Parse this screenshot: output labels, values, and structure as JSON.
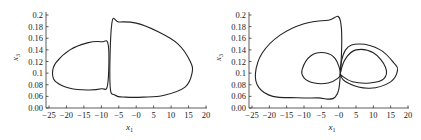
{
  "chart_data": [
    {
      "type": "line",
      "title": "",
      "xlabel": "x1",
      "ylabel": "x3",
      "xlim": [
        -25,
        20
      ],
      "ylim": [
        0.0,
        0.2
      ],
      "grid": false,
      "legend": null,
      "xticks": [
        "-25",
        "-20",
        "-15",
        "-10",
        "-5",
        "-0",
        "5",
        "10",
        "15",
        "20"
      ],
      "yticks": [
        "0.00",
        "0.06",
        "0.08",
        "0.1",
        "0.12",
        "0.14",
        "0.16",
        "0.18",
        "0.2"
      ],
      "series": [
        {
          "name": "left lobe",
          "x": [
            -8,
            -10,
            -14,
            -19,
            -23,
            -24,
            -23,
            -19,
            -14,
            -10,
            -8.2,
            -8
          ],
          "y": [
            0.148,
            0.154,
            0.152,
            0.14,
            0.118,
            0.1,
            0.085,
            0.074,
            0.071,
            0.073,
            0.08,
            0.148
          ]
        },
        {
          "name": "right lobe",
          "x": [
            -7.5,
            -7,
            -5,
            0,
            6,
            12,
            15.5,
            16,
            14,
            8,
            2,
            -3,
            -6,
            -7.5
          ],
          "y": [
            0.08,
            0.185,
            0.188,
            0.186,
            0.172,
            0.15,
            0.12,
            0.1,
            0.076,
            0.062,
            0.056,
            0.056,
            0.062,
            0.08
          ]
        }
      ]
    },
    {
      "type": "line",
      "title": "",
      "xlabel": "x1",
      "ylabel": "x3",
      "xlim": [
        -25,
        20
      ],
      "ylim": [
        0.0,
        0.2
      ],
      "grid": false,
      "legend": null,
      "xticks": [
        "-25",
        "-20",
        "-15",
        "-10",
        "-5",
        "-0",
        "5",
        "10",
        "15",
        "20"
      ],
      "yticks": [
        "0.00",
        "0.06",
        "0.08",
        "0.1",
        "0.12",
        "0.14",
        "0.16",
        "0.18",
        "0.2"
      ],
      "series": [
        {
          "name": "outer left loop",
          "x": [
            0.5,
            0.5,
            -3,
            -10,
            -17,
            -22,
            -24,
            -23,
            -19,
            -12,
            -6,
            -1,
            0.5
          ],
          "y": [
            0.1,
            0.19,
            0.191,
            0.185,
            0.165,
            0.135,
            0.1,
            0.075,
            0.06,
            0.053,
            0.052,
            0.056,
            0.1
          ]
        },
        {
          "name": "inner left loop",
          "x": [
            0.5,
            -1,
            -4,
            -8,
            -10.5,
            -10,
            -7,
            -3,
            -0.5,
            0.5
          ],
          "y": [
            0.1,
            0.125,
            0.135,
            0.13,
            0.107,
            0.092,
            0.083,
            0.083,
            0.09,
            0.1
          ]
        },
        {
          "name": "inner right loop",
          "x": [
            0.5,
            2,
            5,
            10,
            13.5,
            13,
            9,
            4,
            1,
            0.5
          ],
          "y": [
            0.1,
            0.125,
            0.14,
            0.135,
            0.11,
            0.09,
            0.083,
            0.085,
            0.095,
            0.1
          ]
        },
        {
          "name": "outer right loop",
          "x": [
            0.5,
            2,
            6,
            12,
            16,
            17,
            15,
            9,
            3,
            0.5
          ],
          "y": [
            0.1,
            0.14,
            0.15,
            0.14,
            0.117,
            0.105,
            0.085,
            0.074,
            0.082,
            0.1
          ]
        }
      ]
    }
  ],
  "charts": {
    "left": {
      "xlabel": "x",
      "xlabel_sub": "1",
      "ylabel": "x",
      "ylabel_sub": "3",
      "xticks": [
        "-25",
        "-20",
        "-15",
        "-10",
        "-5",
        "-0",
        "5",
        "10",
        "15",
        "20"
      ],
      "yticks": [
        "0.00",
        "0.06",
        "0.08",
        "0.1",
        "0.12",
        "0.14",
        "0.16",
        "0.18",
        "0.2"
      ]
    },
    "right": {
      "xlabel": "x",
      "xlabel_sub": "1",
      "ylabel": "x",
      "ylabel_sub": "3",
      "xticks": [
        "-25",
        "-20",
        "-15",
        "-10",
        "-5",
        "-0",
        "5",
        "10",
        "15",
        "20"
      ],
      "yticks": [
        "0.00",
        "0.06",
        "0.08",
        "0.1",
        "0.12",
        "0.14",
        "0.16",
        "0.18",
        "0.2"
      ]
    }
  },
  "colors": {
    "line": "#222222",
    "axis": "#333333",
    "background": "#ffffff"
  }
}
